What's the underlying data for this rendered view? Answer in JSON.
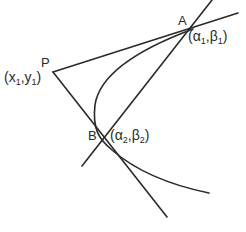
{
  "diagram": {
    "type": "geometry",
    "points": {
      "P": {
        "label": "P",
        "coord_label": "(x1,y1)",
        "x_sym": "x",
        "y_sym": "y",
        "sub": "1"
      },
      "A": {
        "label": "A",
        "coord_label": "(α1,β1)",
        "x_sym": "α",
        "y_sym": "β",
        "sub": "1"
      },
      "B": {
        "label": "B",
        "coord_label": "(α2,β2)",
        "x_sym": "α",
        "y_sym": "β",
        "sub": "2"
      }
    },
    "elements": [
      "parabola",
      "tangent PA",
      "tangent PB",
      "chord of contact AB"
    ],
    "stroke_color": "#2a2a2a",
    "background": "#ffffff"
  }
}
